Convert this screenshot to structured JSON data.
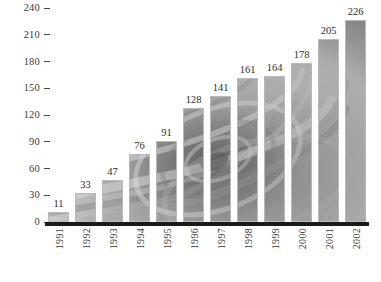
{
  "chart_data": {
    "type": "bar",
    "title": "",
    "subtitle": "",
    "xlabel": "",
    "ylabel": "",
    "categories": [
      "1991",
      "1992",
      "1993",
      "1994",
      "1995",
      "1996",
      "1997",
      "1998",
      "1999",
      "2000",
      "2001",
      "2002"
    ],
    "values": [
      11,
      33,
      47,
      76,
      91,
      128,
      141,
      161,
      164,
      178,
      205,
      226
    ],
    "data_labels": [
      "11",
      "33",
      "47",
      "76",
      "91",
      "128",
      "141",
      "161",
      "164",
      "178",
      "205",
      "226"
    ],
    "ylim": [
      0,
      240
    ],
    "yticks": [
      0,
      30,
      60,
      90,
      120,
      150,
      180,
      210,
      240
    ],
    "ytick_labels": [
      "0",
      "30",
      "60",
      "90",
      "120",
      "150",
      "180",
      "210",
      "240"
    ],
    "grid": false,
    "legend": null,
    "legend_position": "none",
    "bar_fill": "grayscale-swirl-image-texture",
    "xtick_rotation": 90,
    "axis_line_color": "#1a1a1a",
    "text_color": "#2b2b2b",
    "background_color": "#ffffff"
  },
  "axes": {
    "y": {
      "ticks": [
        {
          "label": "240",
          "value": 240
        },
        {
          "label": "210",
          "value": 210
        },
        {
          "label": "180",
          "value": 180
        },
        {
          "label": "150",
          "value": 150
        },
        {
          "label": "120",
          "value": 120
        },
        {
          "label": "90",
          "value": 90
        },
        {
          "label": "60",
          "value": 60
        },
        {
          "label": "30",
          "value": 30
        },
        {
          "label": "0",
          "value": 0
        }
      ]
    }
  },
  "bars": [
    {
      "category": "1991",
      "value": 11,
      "label": "11"
    },
    {
      "category": "1992",
      "value": 33,
      "label": "33"
    },
    {
      "category": "1993",
      "value": 47,
      "label": "47"
    },
    {
      "category": "1994",
      "value": 76,
      "label": "76"
    },
    {
      "category": "1995",
      "value": 91,
      "label": "91"
    },
    {
      "category": "1996",
      "value": 128,
      "label": "128"
    },
    {
      "category": "1997",
      "value": 141,
      "label": "141"
    },
    {
      "category": "1998",
      "value": 161,
      "label": "161"
    },
    {
      "category": "1999",
      "value": 164,
      "label": "164"
    },
    {
      "category": "2000",
      "value": 178,
      "label": "178"
    },
    {
      "category": "2001",
      "value": 205,
      "label": "205"
    },
    {
      "category": "2002",
      "value": 226,
      "label": "226"
    }
  ]
}
